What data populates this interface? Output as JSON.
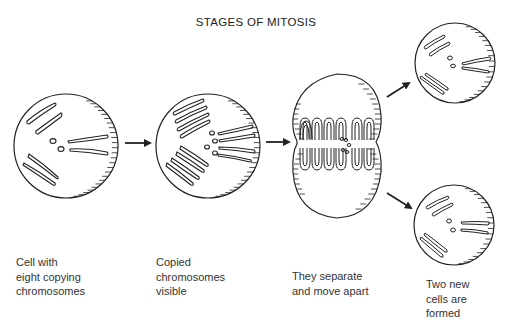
{
  "title": "STAGES OF MITOSIS",
  "stages": [
    {
      "id": "stage-1",
      "caption": [
        "Cell with",
        "eight copying",
        "chromosomes"
      ]
    },
    {
      "id": "stage-2",
      "caption": [
        "Copied",
        "chromosomes",
        "visible"
      ]
    },
    {
      "id": "stage-3",
      "caption": [
        "They separate",
        "and move apart"
      ]
    },
    {
      "id": "stage-4",
      "caption": [
        "Two new",
        "cells are",
        "formed"
      ]
    }
  ],
  "colors": {
    "ink": "#222222",
    "background": "#ffffff"
  }
}
